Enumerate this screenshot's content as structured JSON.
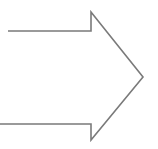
{
  "diagram": {
    "shape": "right-arrow-outline",
    "stroke_color": "#7a7a7a",
    "background": "#ffffff"
  }
}
